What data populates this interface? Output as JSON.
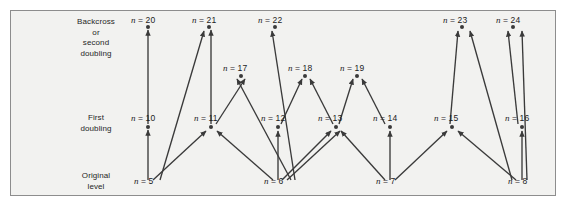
{
  "figure": {
    "background_color": "#f2f2f0",
    "border_color": "#8d8d8d",
    "line_color": "#3a3a3a"
  },
  "row_labels": [
    {
      "id": "backcross",
      "text": "Backcross\nor\nsecond\ndoubling"
    },
    {
      "id": "first-doubling",
      "text": "First\ndoubling"
    },
    {
      "id": "original-level",
      "text": "Original\nlevel"
    }
  ],
  "nodes": {
    "top_row": [
      {
        "id": "n20",
        "label": "n = 20",
        "value": 20,
        "x": 148,
        "y": 27,
        "label_x": 131,
        "label_y": 15
      },
      {
        "id": "n21",
        "label": "n = 21",
        "value": 21,
        "x": 209,
        "y": 27,
        "label_x": 192,
        "label_y": 15
      },
      {
        "id": "n22",
        "label": "n = 22",
        "value": 22,
        "x": 275,
        "y": 27,
        "label_x": 258,
        "label_y": 15
      },
      {
        "id": "n23",
        "label": "n = 23",
        "value": 23,
        "x": 462,
        "y": 27,
        "label_x": 443,
        "label_y": 15
      },
      {
        "id": "n24",
        "label": "n = 24",
        "value": 24,
        "x": 513,
        "y": 27,
        "label_x": 496,
        "label_y": 15
      }
    ],
    "mid_upper_row": [
      {
        "id": "n17",
        "label": "n = 17",
        "value": 17,
        "x": 241,
        "y": 76,
        "label_x": 223,
        "label_y": 63
      },
      {
        "id": "n18",
        "label": "n = 18",
        "value": 18,
        "x": 305,
        "y": 76,
        "label_x": 288,
        "label_y": 63
      },
      {
        "id": "n19",
        "label": "n = 19",
        "value": 19,
        "x": 357,
        "y": 76,
        "label_x": 340,
        "label_y": 63
      }
    ],
    "middle_row": [
      {
        "id": "n10",
        "label": "n = 10",
        "value": 10,
        "x": 148,
        "y": 127,
        "label_x": 131,
        "label_y": 113
      },
      {
        "id": "n11",
        "label": "n = 11",
        "value": 11,
        "x": 211,
        "y": 127,
        "label_x": 194,
        "label_y": 113
      },
      {
        "id": "n12",
        "label": "n = 12",
        "value": 12,
        "x": 278,
        "y": 127,
        "label_x": 261,
        "label_y": 113
      },
      {
        "id": "n13",
        "label": "n = 13",
        "value": 13,
        "x": 336,
        "y": 127,
        "label_x": 318,
        "label_y": 113
      },
      {
        "id": "n14",
        "label": "n = 14",
        "value": 14,
        "x": 390,
        "y": 127,
        "label_x": 373,
        "label_y": 113
      },
      {
        "id": "n15",
        "label": "n = 15",
        "value": 15,
        "x": 452,
        "y": 127,
        "label_x": 434,
        "label_y": 113
      },
      {
        "id": "n16",
        "label": "n = 16",
        "value": 16,
        "x": 522,
        "y": 127,
        "label_x": 505,
        "label_y": 113
      }
    ],
    "bottom_row": [
      {
        "id": "n5",
        "label": "n = 5",
        "value": 5,
        "x": 148,
        "y": 183,
        "label_x": 134,
        "label_y": 176
      },
      {
        "id": "n6",
        "label": "n = 6",
        "value": 6,
        "x": 278,
        "y": 183,
        "label_x": 264,
        "label_y": 176
      },
      {
        "id": "n7",
        "label": "n = 7",
        "value": 7,
        "x": 390,
        "y": 183,
        "label_x": 376,
        "label_y": 176
      },
      {
        "id": "n8",
        "label": "n = 8",
        "value": 8,
        "x": 522,
        "y": 183,
        "label_x": 508,
        "label_y": 176
      }
    ]
  },
  "arrows": [
    {
      "from": "n5",
      "to": "n10",
      "x1": 148,
      "y1": 180,
      "x2": 148,
      "y2": 130
    },
    {
      "from": "n5",
      "to": "n11",
      "x1": 153,
      "y1": 180,
      "x2": 206,
      "y2": 131
    },
    {
      "from": "n6",
      "to": "n11",
      "x1": 273,
      "y1": 180,
      "x2": 217,
      "y2": 131
    },
    {
      "from": "n6",
      "to": "n12",
      "x1": 278,
      "y1": 180,
      "x2": 278,
      "y2": 131
    },
    {
      "from": "n6",
      "to": "n13",
      "x1": 282,
      "y1": 180,
      "x2": 331,
      "y2": 131
    },
    {
      "from": "n6",
      "to": "n13b",
      "x1": 287,
      "y1": 180,
      "x2": 340,
      "y2": 131
    },
    {
      "from": "n6",
      "to": "n17",
      "x1": 291,
      "y1": 180,
      "x2": 237,
      "y2": 79
    },
    {
      "from": "n6",
      "to": "n22",
      "x1": 295,
      "y1": 180,
      "x2": 272,
      "y2": 31
    },
    {
      "from": "n7",
      "to": "n13",
      "x1": 385,
      "y1": 180,
      "x2": 341,
      "y2": 131
    },
    {
      "from": "n7",
      "to": "n14",
      "x1": 390,
      "y1": 180,
      "x2": 390,
      "y2": 131
    },
    {
      "from": "n7",
      "to": "n15",
      "x1": 395,
      "y1": 180,
      "x2": 447,
      "y2": 131
    },
    {
      "from": "n8",
      "to": "n15",
      "x1": 516,
      "y1": 180,
      "x2": 458,
      "y2": 131
    },
    {
      "from": "n8",
      "to": "n16",
      "x1": 522,
      "y1": 180,
      "x2": 522,
      "y2": 131
    },
    {
      "from": "n8",
      "to": "n23",
      "x1": 512,
      "y1": 180,
      "x2": 470,
      "y2": 31
    },
    {
      "from": "n8",
      "to": "n24",
      "x1": 527,
      "y1": 180,
      "x2": 522,
      "y2": 31
    },
    {
      "from": "n10",
      "to": "n20",
      "x1": 148,
      "y1": 124,
      "x2": 148,
      "y2": 30
    },
    {
      "from": "n11",
      "to": "n21",
      "x1": 211,
      "y1": 124,
      "x2": 211,
      "y2": 30
    },
    {
      "from": "n11",
      "to": "n17",
      "x1": 216,
      "y1": 124,
      "x2": 245,
      "y2": 79
    },
    {
      "from": "n12",
      "to": "n18",
      "x1": 281,
      "y1": 124,
      "x2": 302,
      "y2": 79
    },
    {
      "from": "n13",
      "to": "n18",
      "x1": 333,
      "y1": 124,
      "x2": 310,
      "y2": 79
    },
    {
      "from": "n13",
      "to": "n19",
      "x1": 339,
      "y1": 124,
      "x2": 353,
      "y2": 79
    },
    {
      "from": "n14",
      "to": "n19",
      "x1": 385,
      "y1": 124,
      "x2": 362,
      "y2": 79
    },
    {
      "from": "n15",
      "to": "n23",
      "x1": 450,
      "y1": 124,
      "x2": 458,
      "y2": 31
    },
    {
      "from": "n16",
      "to": "n24",
      "x1": 518,
      "y1": 124,
      "x2": 508,
      "y2": 31
    },
    {
      "from": "n5b",
      "to": "n21",
      "x1": 160,
      "y1": 180,
      "x2": 204,
      "y2": 31
    }
  ]
}
